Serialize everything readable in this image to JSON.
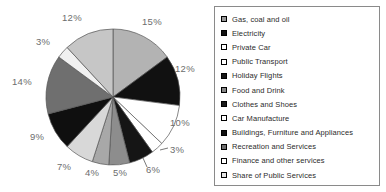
{
  "chart_data": {
    "type": "pie",
    "title": "",
    "legend_position": "right",
    "start_angle_deg": 0,
    "direction": "clockwise",
    "categories": [
      "Gas, coal and oil",
      "Electricity",
      "Private Car",
      "Public Transport",
      "Holiday Flights",
      "Food and Drink",
      "Clothes and Shoes",
      "Car Manufacture",
      "Buildings, Furniture and Appliances",
      "Recreation and Services",
      "Finance and other services",
      "Share of Public Services"
    ],
    "values": [
      15,
      12,
      10,
      3,
      6,
      5,
      4,
      7,
      9,
      14,
      3,
      12
    ],
    "value_labels": [
      "15%",
      "12%",
      "10%",
      "3%",
      "6%",
      "5%",
      "4%",
      "7%",
      "9%",
      "14%",
      "3%",
      "12%"
    ],
    "colors": [
      "#b3b3b3",
      "#111111",
      "#ffffff",
      "#ffffff",
      "#151515",
      "#8d8d8d",
      "#a8a8a8",
      "#d8d8d8",
      "#0f0f0f",
      "#6f6f6f",
      "#f1f1f1",
      "#c6c6c6"
    ],
    "slice_outline_color": "#555555"
  },
  "pie": {
    "labels": [
      {
        "text": "15%",
        "left": 142,
        "top": 16
      },
      {
        "text": "12%",
        "left": 175,
        "top": 63
      },
      {
        "text": "10%",
        "left": 170,
        "top": 117
      },
      {
        "text": "3%",
        "left": 170,
        "top": 144
      },
      {
        "text": "6%",
        "left": 146,
        "top": 164
      },
      {
        "text": "5%",
        "left": 113,
        "top": 167
      },
      {
        "text": "4%",
        "left": 85,
        "top": 167
      },
      {
        "text": "7%",
        "left": 57,
        "top": 161
      },
      {
        "text": "9%",
        "left": 30,
        "top": 131
      },
      {
        "text": "14%",
        "left": 12,
        "top": 76
      },
      {
        "text": "3%",
        "left": 36,
        "top": 36
      },
      {
        "text": "12%",
        "left": 62,
        "top": 12
      }
    ],
    "leader_lines": [
      {
        "x1": 160,
        "y1": 150,
        "x2": 168,
        "y2": 148
      },
      {
        "x1": 143,
        "y1": 158,
        "x2": 147,
        "y2": 167
      }
    ]
  },
  "legend": {
    "items": [
      {
        "label": "Gas, coal and oil",
        "swatch": "#9a9a9a"
      },
      {
        "label": "Electricity",
        "swatch": "#111111"
      },
      {
        "label": "Private Car",
        "swatch": "#ffffff"
      },
      {
        "label": "Public Transport",
        "swatch": "#ffffff"
      },
      {
        "label": "Holiday Flights",
        "swatch": "#151515"
      },
      {
        "label": "Food and Drink",
        "swatch": "#868686"
      },
      {
        "label": "Clothes and Shoes",
        "swatch": "#1a1a1a"
      },
      {
        "label": "Car Manufacture",
        "swatch": "#ffffff"
      },
      {
        "label": "Buildings, Furniture and Appliances",
        "swatch": "#0f0f0f"
      },
      {
        "label": "Recreation and Services",
        "swatch": "#6f6f6f"
      },
      {
        "label": "Finance and other services",
        "swatch": "#ffffff"
      },
      {
        "label": "Share of Public Services",
        "swatch": "#e4e4e4"
      }
    ]
  }
}
